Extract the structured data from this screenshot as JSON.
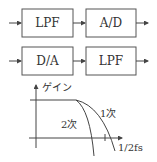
{
  "block_diagram": {
    "rows": [
      {
        "blocks": [
          {
            "label": "LPF"
          },
          {
            "label": "A/D"
          }
        ]
      },
      {
        "blocks": [
          {
            "label": "D/A"
          },
          {
            "label": "LPF"
          }
        ]
      }
    ]
  },
  "graph": {
    "y_axis_label": "ゲイン",
    "x_axis_label": "1/2fs",
    "curves": [
      {
        "label": "1次"
      },
      {
        "label": "2次"
      }
    ]
  },
  "colors": {
    "stroke": "#444444",
    "text": "#333333",
    "background": "#ffffff"
  }
}
